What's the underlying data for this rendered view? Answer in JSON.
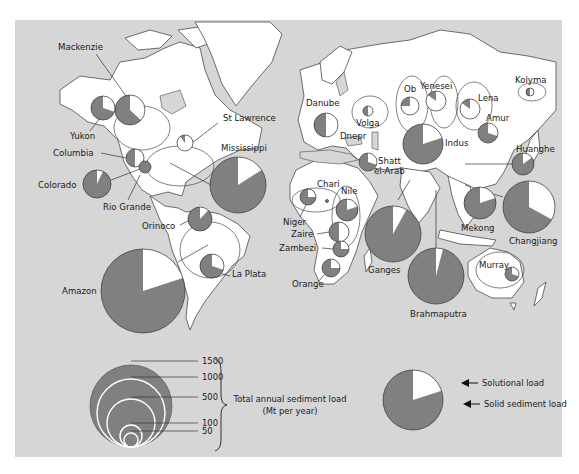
{
  "colors": {
    "background": "#d6d6d6",
    "land": "#ffffff",
    "solid_sediment": "#808080",
    "solutional": "#ffffff",
    "outline": "#4a4a4a"
  },
  "rivers": [
    {
      "name": "Mackenzie",
      "cx": 130,
      "cy": 110,
      "r": 15,
      "solutional": 0.37,
      "label": {
        "x": 58,
        "y": 50
      },
      "leader": [
        [
          96,
          54
        ],
        [
          126,
          96
        ]
      ]
    },
    {
      "name": "Yukon",
      "cx": 103,
      "cy": 108,
      "r": 12,
      "solutional": 0.3,
      "label": {
        "x": 70,
        "y": 139
      },
      "leader": [
        [
          90,
          131
        ],
        [
          100,
          118
        ]
      ]
    },
    {
      "name": "Columbia",
      "cx": 135,
      "cy": 158,
      "r": 9,
      "solutional": 0.5,
      "label": {
        "x": 53,
        "y": 156
      },
      "leader": [
        [
          101,
          153
        ],
        [
          126,
          158
        ]
      ]
    },
    {
      "name": "St Lawrence",
      "cx": 185,
      "cy": 143,
      "r": 8,
      "solutional": 0.9,
      "label": {
        "x": 223,
        "y": 121
      },
      "leader": [
        [
          218,
          123
        ],
        [
          188,
          146
        ]
      ]
    },
    {
      "name": "Mississippi",
      "cx": 238,
      "cy": 185,
      "r": 28,
      "solutional": 0.16,
      "label": {
        "x": 221,
        "y": 151
      },
      "leader": [
        [
          211,
          185
        ],
        [
          170,
          163
        ]
      ]
    },
    {
      "name": "Colorado",
      "cx": 97,
      "cy": 184,
      "r": 14,
      "solutional": 0.07,
      "label": {
        "x": 38,
        "y": 188
      },
      "leader": [
        [
          111,
          180
        ],
        [
          140,
          169
        ]
      ]
    },
    {
      "name": "Rio Grande",
      "cx": 145,
      "cy": 167,
      "r": 6,
      "solutional": 0.0,
      "label": {
        "x": 103,
        "y": 210
      },
      "leader": [
        [
          128,
          200
        ],
        [
          140,
          175
        ]
      ]
    },
    {
      "name": "Orinoco",
      "cx": 200,
      "cy": 219,
      "r": 12,
      "solutional": 0.12,
      "label": {
        "x": 142,
        "y": 229
      },
      "leader": [
        [
          180,
          225
        ],
        [
          188,
          221
        ]
      ]
    },
    {
      "name": "Amazon",
      "cx": 143,
      "cy": 291,
      "r": 42,
      "solutional": 0.2,
      "label": {
        "x": 62,
        "y": 294
      },
      "leader": [
        [
          178,
          262
        ],
        [
          208,
          245
        ]
      ]
    },
    {
      "name": "La Plata",
      "cx": 212,
      "cy": 266,
      "r": 12,
      "solutional": 0.3,
      "label": {
        "x": 232,
        "y": 277
      },
      "leader": [
        [
          219,
          273
        ],
        [
          230,
          276
        ]
      ]
    },
    {
      "name": "Danube",
      "cx": 326,
      "cy": 125,
      "r": 12,
      "solutional": 0.5,
      "label": {
        "x": 306,
        "y": 106
      },
      "leader": []
    },
    {
      "name": "Volga",
      "cx": 368,
      "cy": 111,
      "r": 5,
      "solutional": 0.5,
      "label": {
        "x": 356,
        "y": 126
      },
      "leader": []
    },
    {
      "name": "Dnepr",
      "cx": 0,
      "cy": 0,
      "r": 0,
      "solutional": 0,
      "label": {
        "x": 340,
        "y": 139
      },
      "leader": []
    },
    {
      "name": "Shatt el-Arab",
      "cx": 368,
      "cy": 162,
      "r": 9,
      "solutional": 0.3,
      "label": {
        "x": 378,
        "y": 164
      },
      "label2": "el-Arab",
      "leader": []
    },
    {
      "name": "Ob",
      "cx": 410,
      "cy": 106,
      "r": 9,
      "solutional": 0.75,
      "label": {
        "x": 404,
        "y": 92
      },
      "leader": []
    },
    {
      "name": "Yenesei",
      "cx": 436,
      "cy": 101,
      "r": 10,
      "solutional": 0.85,
      "label": {
        "x": 420,
        "y": 89
      },
      "leader": []
    },
    {
      "name": "Lena",
      "cx": 470,
      "cy": 109,
      "r": 10,
      "solutional": 0.85,
      "label": {
        "x": 478,
        "y": 101
      },
      "leader": []
    },
    {
      "name": "Kolyma",
      "cx": 530,
      "cy": 92,
      "r": 4,
      "solutional": 0.5,
      "label": {
        "x": 515,
        "y": 83
      },
      "leader": []
    },
    {
      "name": "Amur",
      "cx": 488,
      "cy": 133,
      "r": 10,
      "solutional": 0.3,
      "label": {
        "x": 486,
        "y": 121
      },
      "leader": []
    },
    {
      "name": "Indus",
      "cx": 423,
      "cy": 144,
      "r": 20,
      "solutional": 0.2,
      "label": {
        "x": 445,
        "y": 146
      },
      "leader": []
    },
    {
      "name": "Huanghe",
      "cx": 523,
      "cy": 164,
      "r": 11,
      "solutional": 0.15,
      "label": {
        "x": 516,
        "y": 152
      },
      "leader": [
        [
          465,
          164
        ],
        [
          512,
          164
        ]
      ]
    },
    {
      "name": "Changjiang",
      "cx": 529,
      "cy": 207,
      "r": 26,
      "solutional": 0.33,
      "label": {
        "x": 509,
        "y": 244
      },
      "leader": [
        [
          465,
          185
        ],
        [
          503,
          197
        ]
      ]
    },
    {
      "name": "Mekong",
      "cx": 480,
      "cy": 203,
      "r": 16,
      "solutional": 0.2,
      "label": {
        "x": 461,
        "y": 231
      },
      "leader": []
    },
    {
      "name": "Ganges",
      "cx": 393,
      "cy": 234,
      "r": 28,
      "solutional": 0.08,
      "label": {
        "x": 368,
        "y": 273
      },
      "leader": [
        [
          398,
          200
        ],
        [
          410,
          180
        ]
      ]
    },
    {
      "name": "Brahmaputra",
      "cx": 436,
      "cy": 276,
      "r": 28,
      "solutional": 0.04,
      "label": {
        "x": 410,
        "y": 317
      },
      "leader": [
        [
          436,
          276
        ],
        [
          436,
          190
        ]
      ]
    },
    {
      "name": "Murray",
      "cx": 512,
      "cy": 274,
      "r": 7,
      "solutional": 0.3,
      "label": {
        "x": 479,
        "y": 268
      },
      "leader": []
    },
    {
      "name": "Niger",
      "cx": 308,
      "cy": 197,
      "r": 8,
      "solutional": 0.25,
      "label": {
        "x": 283,
        "y": 225
      },
      "leader": [
        [
          300,
          217
        ],
        [
          306,
          205
        ]
      ]
    },
    {
      "name": "Chari",
      "cx": 327,
      "cy": 201,
      "r": 1.5,
      "solutional": 0,
      "label": {
        "x": 317,
        "y": 187
      },
      "leader": []
    },
    {
      "name": "Nile",
      "cx": 347,
      "cy": 210,
      "r": 11,
      "solutional": 0.2,
      "label": {
        "x": 341,
        "y": 194
      },
      "leader": []
    },
    {
      "name": "Zaire",
      "cx": 339,
      "cy": 232,
      "r": 10,
      "solutional": 0.5,
      "label": {
        "x": 291,
        "y": 237
      },
      "leader": [
        [
          317,
          234
        ],
        [
          329,
          232
        ]
      ]
    },
    {
      "name": "Zambezi",
      "cx": 341,
      "cy": 249,
      "r": 8,
      "solutional": 0.25,
      "label": {
        "x": 279,
        "y": 251
      },
      "leader": [
        [
          322,
          248
        ],
        [
          333,
          249
        ]
      ]
    },
    {
      "name": "Orange",
      "cx": 331,
      "cy": 268,
      "r": 9,
      "solutional": 0.25,
      "label": {
        "x": 292,
        "y": 287
      },
      "leader": [
        [
          318,
          282
        ],
        [
          324,
          275
        ]
      ]
    }
  ],
  "legend_size": {
    "title_line1": "Total annual sediment load",
    "title_line2": "(Mt per year)",
    "circles": [
      {
        "value": "1500",
        "r": 41
      },
      {
        "value": "1000",
        "r": 34
      },
      {
        "value": "500",
        "r": 24
      },
      {
        "value": "100",
        "r": 11
      },
      {
        "value": "50",
        "r": 7
      }
    ]
  },
  "legend_pie": {
    "solutional_label": "Solutional load",
    "solid_label": "Solid sediment load",
    "solutional_fraction": 0.2
  }
}
